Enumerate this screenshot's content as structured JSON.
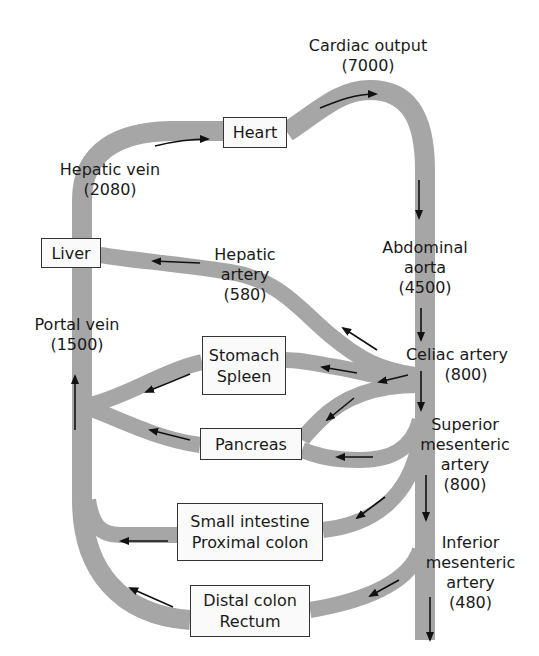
{
  "colors": {
    "vessel": "#a6a6a6",
    "arrow": "#111111",
    "box_border": "#333333",
    "text": "#1a1a1a"
  },
  "organs": {
    "heart": "Heart",
    "liver": "Liver",
    "stomach_spleen": [
      "Stomach",
      "Spleen"
    ],
    "pancreas": "Pancreas",
    "small_intestine": [
      "Small intestine",
      "Proximal colon"
    ],
    "distal_colon": [
      "Distal colon",
      "Rectum"
    ]
  },
  "vessels": {
    "cardiac_output": {
      "name": "Cardiac output",
      "flow": "(7000)"
    },
    "hepatic_vein": {
      "name": "Hepatic vein",
      "flow": "(2080)"
    },
    "hepatic_artery": {
      "name": [
        "Hepatic",
        "artery"
      ],
      "flow": "(580)"
    },
    "abdominal_aorta": {
      "name": [
        "Abdominal",
        "aorta"
      ],
      "flow": "(4500)"
    },
    "portal_vein": {
      "name": "Portal vein",
      "flow": "(1500)"
    },
    "celiac_artery": {
      "name": "Celiac artery",
      "flow": "(800)"
    },
    "superior_mesenteric": {
      "name": [
        "Superior",
        "mesenteric",
        "artery"
      ],
      "flow": "(800)"
    },
    "inferior_mesenteric": {
      "name": [
        "Inferior",
        "mesenteric",
        "artery"
      ],
      "flow": "(480)"
    }
  }
}
